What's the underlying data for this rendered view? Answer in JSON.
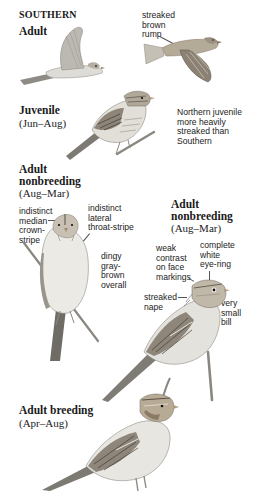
{
  "page": {
    "section_title": "SOUTHERN",
    "blocks": [
      {
        "id": "adult-flight",
        "label": "Adult",
        "dates": ""
      },
      {
        "id": "juvenile",
        "label": "Juvenile",
        "dates": "(Jun–Aug)"
      },
      {
        "id": "adult-nonbreeding-front",
        "label_line1": "Adult",
        "label_line2": "nonbreeding",
        "dates": "(Aug–Mar)"
      },
      {
        "id": "adult-nonbreeding-side",
        "label_line1": "Adult",
        "label_line2": "nonbreeding",
        "dates": "(Aug–Mar)"
      },
      {
        "id": "adult-breeding",
        "label": "Adult breeding",
        "dates": "(Apr–Aug)"
      }
    ],
    "annotations": {
      "rump": [
        "streaked",
        "brown",
        "rump"
      ],
      "juvenile_note": [
        "Northern juvenile",
        "more heavily",
        "streaked than",
        "Southern"
      ],
      "crown_stripe": [
        "indistinct",
        "median",
        "crown-",
        "stripe"
      ],
      "throat_stripe": [
        "indistinct",
        "lateral",
        "throat-stripe"
      ],
      "overall": [
        "dingy",
        "gray-",
        "brown",
        "overall"
      ],
      "face_markings": [
        "weak",
        "contrast",
        "on face",
        "markings"
      ],
      "eye_ring": [
        "complete",
        "white",
        "eye-ring"
      ],
      "nape": [
        "streaked",
        "nape"
      ],
      "bill": [
        "very",
        "small",
        "bill"
      ]
    },
    "colors": {
      "text": "#1a1a1a",
      "bird_gray": "#9a9893",
      "bird_light": "#e4e2dd",
      "bird_brown": "#8a7a66",
      "bird_dark": "#4a463f",
      "branch": "#8b8780"
    }
  }
}
